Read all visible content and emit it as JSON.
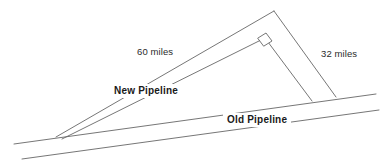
{
  "figure": {
    "background_color": "#ffffff",
    "line_color": "#666666",
    "text_color": "#2b2b2b",
    "labels": {
      "hypotenuse": "60 miles",
      "vertical_leg": "32 miles",
      "new_pipeline": "New Pipeline",
      "old_pipeline": "Old Pipeline"
    },
    "geometry": {
      "old_pipeline_upper": {
        "x1": 14,
        "y1": 144,
        "x2": 376,
        "y2": 94
      },
      "old_pipeline_lower": {
        "x1": 22,
        "y1": 159,
        "x2": 379,
        "y2": 110
      },
      "new_pipeline_upper": {
        "x1": 56,
        "y1": 137,
        "x2": 274,
        "y2": 11
      },
      "new_pipeline_lower": {
        "x1": 62,
        "y1": 139,
        "x2": 265,
        "y2": 38
      },
      "right_leg_outer": {
        "x1": 274,
        "y1": 11,
        "x2": 336,
        "y2": 97
      },
      "right_leg_inner": {
        "x1": 265,
        "y1": 38,
        "x2": 312,
        "y2": 101
      },
      "right_angle_marker": [
        {
          "x": 258,
          "y": 38
        },
        {
          "x": 266,
          "y": 33
        },
        {
          "x": 272,
          "y": 41
        },
        {
          "x": 264,
          "y": 46
        }
      ]
    }
  }
}
